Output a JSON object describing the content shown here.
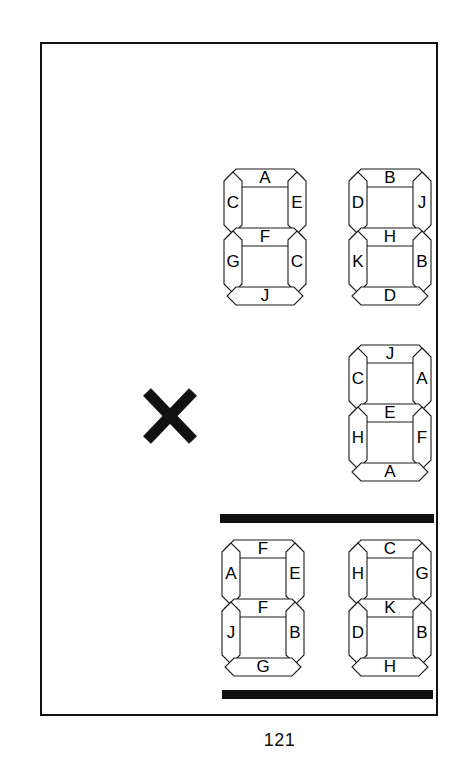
{
  "page": {
    "page_number": "121",
    "frame": {
      "border_color": "#111111"
    },
    "ink_color": "#000000",
    "paper_color": "#ffffff"
  },
  "operator": {
    "name": "multiplication-sign",
    "glyph": "×"
  },
  "rules": [
    {
      "name": "rule-top"
    },
    {
      "name": "rule-bottom"
    }
  ],
  "displays": [
    {
      "id": "display-0",
      "row": "multiplicand",
      "position": "left",
      "segments": {
        "top": "A",
        "top_left": "C",
        "top_right": "E",
        "middle": "F",
        "bottom_left": "G",
        "bottom_right": "C",
        "bottom": "J"
      }
    },
    {
      "id": "display-1",
      "row": "multiplicand",
      "position": "right",
      "segments": {
        "top": "B",
        "top_left": "D",
        "top_right": "J",
        "middle": "H",
        "bottom_left": "K",
        "bottom_right": "B",
        "bottom": "D"
      }
    },
    {
      "id": "display-2",
      "row": "multiplier",
      "position": "right",
      "segments": {
        "top": "J",
        "top_left": "C",
        "top_right": "A",
        "middle": "E",
        "bottom_left": "H",
        "bottom_right": "F",
        "bottom": "A"
      }
    },
    {
      "id": "display-3",
      "row": "product",
      "position": "left",
      "segments": {
        "top": "F",
        "top_left": "A",
        "top_right": "E",
        "middle": "F",
        "bottom_left": "J",
        "bottom_right": "B",
        "bottom": "G"
      }
    },
    {
      "id": "display-4",
      "row": "product",
      "position": "right",
      "segments": {
        "top": "C",
        "top_left": "H",
        "top_right": "G",
        "middle": "K",
        "bottom_left": "D",
        "bottom_right": "B",
        "bottom": "H"
      }
    }
  ]
}
